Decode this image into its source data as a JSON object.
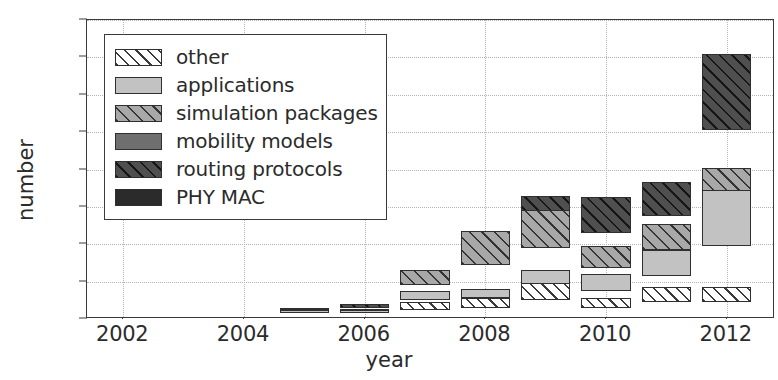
{
  "chart_data": {
    "type": "bar",
    "stacked": true,
    "title": "",
    "xlabel": "year",
    "ylabel": "number",
    "categories": [
      2002,
      2003,
      2004,
      2005,
      2006,
      2007,
      2008,
      2009,
      2010,
      2011,
      2012
    ],
    "xtick_labels": [
      "2002",
      "2004",
      "2006",
      "2008",
      "2010",
      "2012"
    ],
    "xtick_values": [
      2002,
      2004,
      2006,
      2008,
      2010,
      2012
    ],
    "ytick_labels": [
      "0",
      "20",
      "40",
      "60",
      "80",
      "100",
      "120",
      "140",
      "160"
    ],
    "ytick_values": [
      0,
      20,
      40,
      60,
      80,
      100,
      120,
      140,
      160
    ],
    "ylim": [
      0,
      160
    ],
    "xlim": [
      2001.4,
      2012.8
    ],
    "grid": true,
    "legend_position": "upper left",
    "series": [
      {
        "name": "PHY MAC",
        "pattern": "solid-darkest",
        "color": "#2b2b2b",
        "values": [
          0,
          0,
          0,
          0,
          0,
          0,
          2,
          3,
          0,
          0,
          13
        ]
      },
      {
        "name": "routing protocols",
        "pattern": "diagonal-hatch-dark",
        "color": "#4f4f4f",
        "values": [
          0,
          0,
          0,
          1,
          2,
          3,
          8,
          14,
          19,
          18,
          41
        ]
      },
      {
        "name": "mobility models",
        "pattern": "solid-mid",
        "color": "#6f6f6f",
        "values": [
          0,
          0,
          0,
          0,
          0,
          0,
          0,
          0,
          0,
          0,
          0
        ]
      },
      {
        "name": "simulation packages",
        "pattern": "diagonal-hatch-mid",
        "color": "#a8a8a8",
        "values": [
          0,
          0,
          0,
          1,
          1,
          8,
          18,
          20,
          12,
          14,
          21
        ]
      },
      {
        "name": "applications",
        "pattern": "solid-light",
        "color": "#c2c2c2",
        "values": [
          0,
          0,
          0,
          2,
          2,
          5,
          5,
          8,
          9,
          14,
          30
        ]
      },
      {
        "name": "other",
        "pattern": "diagonal-hatch-white",
        "color": "#ffffff",
        "values": [
          0,
          0,
          0,
          0,
          0,
          4,
          5,
          9,
          5,
          8,
          8
        ]
      }
    ],
    "totals": [
      0,
      0,
      0,
      4,
      5,
      20,
      38,
      54,
      45,
      54,
      113
    ]
  },
  "legend": {
    "items": [
      {
        "label": "other",
        "key": "other"
      },
      {
        "label": "applications",
        "key": "applications"
      },
      {
        "label": "simulation packages",
        "key": "simulation"
      },
      {
        "label": "mobility models",
        "key": "mobility"
      },
      {
        "label": "routing protocols",
        "key": "routing"
      },
      {
        "label": "PHY MAC",
        "key": "phymac"
      }
    ]
  }
}
